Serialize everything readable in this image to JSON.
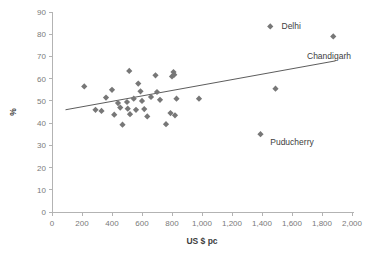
{
  "chart_data": {
    "type": "scatter",
    "title": "",
    "xlabel": "US $ pc",
    "ylabel": "%",
    "xlim": [
      0,
      2000
    ],
    "ylim": [
      0,
      90
    ],
    "grid": false,
    "legend": false,
    "x_ticks": [
      "0",
      "200",
      "400",
      "600",
      "800",
      "1,000",
      "1,200",
      "1,400",
      "1,600",
      "1,800",
      "2,000"
    ],
    "x_tick_values": [
      0,
      200,
      400,
      600,
      800,
      1000,
      1200,
      1400,
      1600,
      1800,
      2000
    ],
    "y_ticks": [
      "0",
      "10",
      "20",
      "30",
      "40",
      "50",
      "60",
      "70",
      "80",
      "90"
    ],
    "y_tick_values": [
      0,
      10,
      20,
      30,
      40,
      50,
      60,
      70,
      80,
      90
    ],
    "marker_color": "#777777",
    "marker_shape": "diamond",
    "points": [
      {
        "x": 215,
        "y": 56.5,
        "label": ""
      },
      {
        "x": 290,
        "y": 46.0,
        "label": ""
      },
      {
        "x": 330,
        "y": 45.5,
        "label": ""
      },
      {
        "x": 360,
        "y": 51.5,
        "label": ""
      },
      {
        "x": 400,
        "y": 55.0,
        "label": ""
      },
      {
        "x": 415,
        "y": 43.8,
        "label": ""
      },
      {
        "x": 440,
        "y": 49.0,
        "label": ""
      },
      {
        "x": 455,
        "y": 47.0,
        "label": ""
      },
      {
        "x": 470,
        "y": 39.3,
        "label": ""
      },
      {
        "x": 500,
        "y": 49.5,
        "label": ""
      },
      {
        "x": 505,
        "y": 46.5,
        "label": ""
      },
      {
        "x": 515,
        "y": 63.5,
        "label": ""
      },
      {
        "x": 520,
        "y": 44.0,
        "label": ""
      },
      {
        "x": 545,
        "y": 51.0,
        "label": ""
      },
      {
        "x": 560,
        "y": 46.0,
        "label": ""
      },
      {
        "x": 575,
        "y": 57.8,
        "label": ""
      },
      {
        "x": 590,
        "y": 54.3,
        "label": ""
      },
      {
        "x": 600,
        "y": 50.0,
        "label": ""
      },
      {
        "x": 615,
        "y": 46.3,
        "label": ""
      },
      {
        "x": 635,
        "y": 43.0,
        "label": ""
      },
      {
        "x": 660,
        "y": 51.8,
        "label": ""
      },
      {
        "x": 690,
        "y": 61.5,
        "label": ""
      },
      {
        "x": 700,
        "y": 54.0,
        "label": ""
      },
      {
        "x": 720,
        "y": 50.5,
        "label": ""
      },
      {
        "x": 760,
        "y": 39.5,
        "label": ""
      },
      {
        "x": 790,
        "y": 44.5,
        "label": ""
      },
      {
        "x": 800,
        "y": 61.0,
        "label": ""
      },
      {
        "x": 810,
        "y": 63.0,
        "label": ""
      },
      {
        "x": 815,
        "y": 61.8,
        "label": ""
      },
      {
        "x": 820,
        "y": 43.5,
        "label": ""
      },
      {
        "x": 830,
        "y": 51.0,
        "label": ""
      },
      {
        "x": 980,
        "y": 51.0,
        "label": ""
      },
      {
        "x": 1390,
        "y": 35.0,
        "label": "Puducherry"
      },
      {
        "x": 1455,
        "y": 83.5,
        "label": "Delhi"
      },
      {
        "x": 1490,
        "y": 55.5,
        "label": ""
      },
      {
        "x": 1875,
        "y": 79.0,
        "label": "Chandigarh"
      }
    ],
    "trendline": {
      "x_start": 90,
      "y_start": 46.0,
      "x_end": 1890,
      "y_end": 68.0,
      "color": "#4a4a4a"
    },
    "annotations": [
      {
        "text": "Delhi",
        "x": 1530,
        "y": 83.5
      },
      {
        "text": "Chandigarh",
        "x": 1700,
        "y": 70.0
      },
      {
        "text": "Puducherry",
        "x": 1455,
        "y": 31.5
      }
    ]
  }
}
